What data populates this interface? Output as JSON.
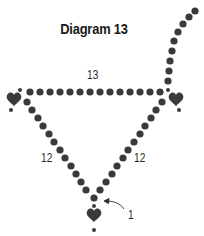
{
  "diagram": {
    "title": "Diagram 13",
    "labels": {
      "top_count": "13",
      "left_count": "12",
      "right_count": "12",
      "bottom_callout": "1"
    },
    "colors": {
      "bead": "#3a3a3a",
      "text": "#1a1a1a",
      "background": "#ffffff"
    },
    "elements": [
      "top strand of 13 beads",
      "left diagonal strand of 12 beads",
      "right diagonal strand of 12 beads",
      "heart charm at left corner",
      "heart charm at right corner",
      "heart charm at bottom",
      "tail strand rising to upper right",
      "arrow pointing to 1 bead at bottom junction"
    ]
  }
}
